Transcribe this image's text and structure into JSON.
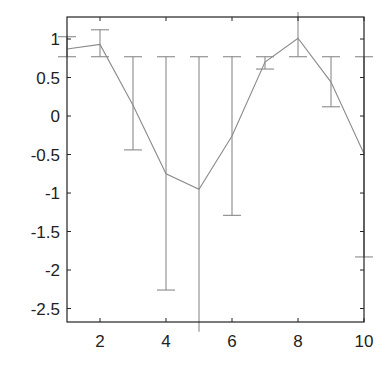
{
  "chart_data": {
    "type": "line",
    "title": "",
    "xlabel": "",
    "ylabel": "",
    "xlim": [
      1,
      10
    ],
    "ylim": [
      -2.675,
      1.286
    ],
    "grid": false,
    "legend": null,
    "x_ticks": [
      2,
      4,
      6,
      8,
      10
    ],
    "x_tick_labels": [
      "2",
      "4",
      "6",
      "8",
      "10"
    ],
    "y_ticks": [
      1,
      0.5,
      0,
      -0.5,
      -1,
      -1.5,
      -2,
      -2.5
    ],
    "y_tick_labels": [
      "1",
      "0.5",
      "0",
      "-0.5",
      "-1",
      "-1.5",
      "-2",
      "-2.5"
    ],
    "series": [
      {
        "name": "series",
        "x": [
          1,
          2,
          3,
          4,
          5,
          6,
          7,
          8,
          9,
          10
        ],
        "values": [
          0.87,
          0.93,
          0.14,
          -0.75,
          -0.95,
          -0.26,
          0.7,
          1.01,
          0.44,
          -0.49
        ],
        "error_upper": [
          1.03,
          1.12,
          0.77,
          0.77,
          0.77,
          0.77,
          0.77,
          1.35,
          0.77,
          0.77
        ],
        "error_lower": [
          0.77,
          0.77,
          -0.44,
          -2.26,
          -2.8,
          -1.29,
          0.61,
          0.77,
          0.12,
          -1.83
        ],
        "color": "#888888"
      }
    ]
  },
  "colors": {
    "axis": "#222222",
    "line": "#8a8a8a",
    "background": "#ffffff"
  }
}
